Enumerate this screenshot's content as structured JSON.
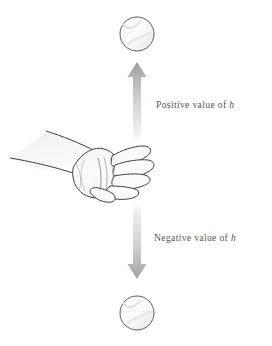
{
  "figure": {
    "width": 272,
    "height": 346,
    "background_color": "#ffffff"
  },
  "colors": {
    "background": "#ffffff",
    "outline": "#4a4a4a",
    "hand_outline": "#3f3f3f",
    "text": "#555555",
    "arrow_dark": "#9a9a9a",
    "arrow_light": "#e8e8e8",
    "ball_fill": "#fdfdfd",
    "ball_stroke": "#595959",
    "ball_shade": "#f0f0f0",
    "arm_fill": "#f4f4f4",
    "hand_fill": "#fbfbfb"
  },
  "captions": [
    {
      "id": "caption-positive",
      "lead": "Positive value of",
      "symbol": "h",
      "full_text": "Positive value of h",
      "x": 156,
      "y": 100
    },
    {
      "id": "caption-negative",
      "lead": "Negative value of",
      "symbol": "h",
      "full_text": "Negative value of h",
      "x": 154,
      "y": 233
    }
  ],
  "balls": [
    {
      "id": "ball-top",
      "name": "ball-above-hand",
      "cx": 137,
      "cy": 34,
      "r": 17
    },
    {
      "id": "ball-bottom",
      "name": "ball-below-hand",
      "cx": 137,
      "cy": 313,
      "r": 17
    }
  ],
  "arrows": [
    {
      "id": "arrow-up",
      "name": "up-arrow",
      "direction": "up",
      "x_center": 137,
      "tip_y": 62,
      "tail_y": 142,
      "shaft_width": 7,
      "head_width": 19,
      "head_height": 15,
      "meaning": "Positive value of h"
    },
    {
      "id": "arrow-down",
      "name": "down-arrow",
      "direction": "down",
      "x_center": 137,
      "tip_y": 279,
      "tail_y": 205,
      "shaft_width": 7,
      "head_width": 19,
      "head_height": 15,
      "meaning": "Negative value of h"
    }
  ],
  "hand": {
    "name": "arm-and-open-hand",
    "label": "forearm with open hand, palm up, fingers extended to the right",
    "bounds": {
      "x": 8,
      "y": 126,
      "width": 150,
      "height": 78
    },
    "finger_count": 4,
    "thumb": true
  }
}
